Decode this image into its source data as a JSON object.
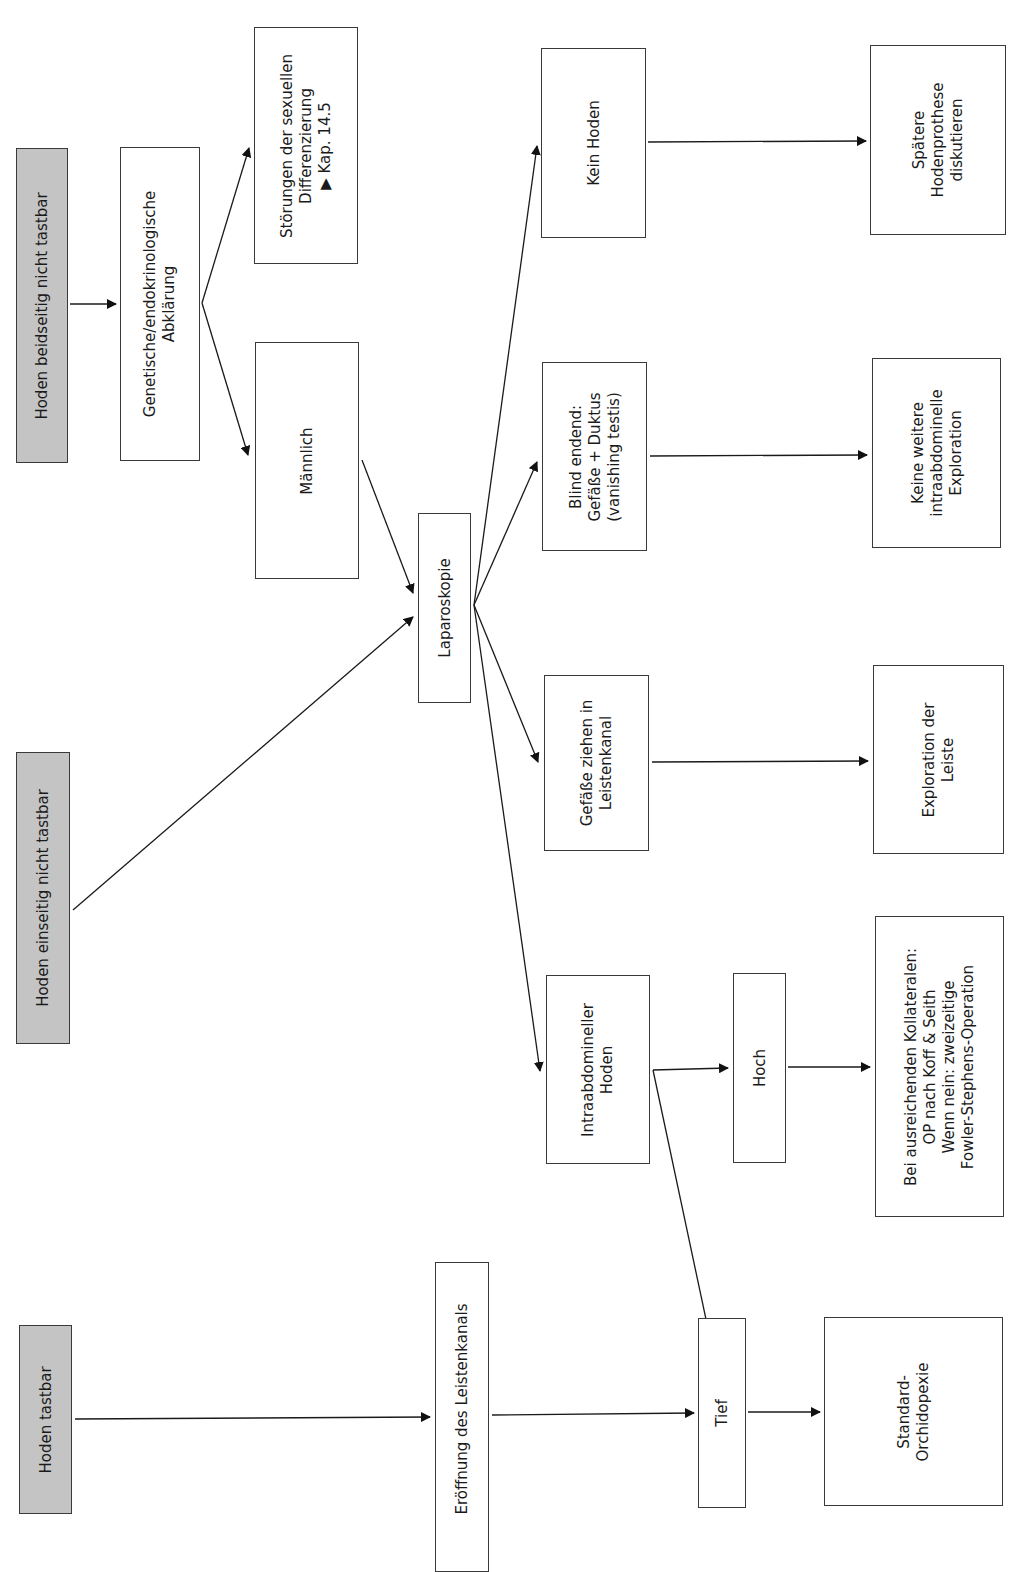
{
  "diagram": {
    "type": "flowchart",
    "orientation": "rotated-90-ccw",
    "colors": {
      "start_fill": "#c4c4c4",
      "box_fill": "#ffffff",
      "stroke": "#1a1a1a"
    },
    "nodes": {
      "beidseitig": {
        "lines": [
          "Hoden beidseitig nicht tastbar"
        ],
        "kind": "start"
      },
      "genetisch": {
        "lines": [
          "Genetische/endokrinologische",
          "Abklärung"
        ],
        "kind": "process"
      },
      "stoerungen": {
        "lines": [
          "Störungen der sexuellen",
          "Differenzierung",
          "▶ Kap. 14.5"
        ],
        "kind": "outcome"
      },
      "maennlich": {
        "lines": [
          "Männlich"
        ],
        "kind": "process"
      },
      "einseitig": {
        "lines": [
          "Hoden einseitig nicht tastbar"
        ],
        "kind": "start"
      },
      "laparoskopie": {
        "lines": [
          "Laparoskopie"
        ],
        "kind": "process"
      },
      "kein_hoden": {
        "lines": [
          "Kein Hoden"
        ],
        "kind": "finding"
      },
      "blind": {
        "lines": [
          "Blind endend:",
          "Gefäße + Duktus",
          "(vanishing testis)"
        ],
        "kind": "finding"
      },
      "gefaesse": {
        "lines": [
          "Gefäße ziehen in",
          "Leistenkanal"
        ],
        "kind": "finding"
      },
      "intraabdominell": {
        "lines": [
          "Intraabdomineller",
          "Hoden"
        ],
        "kind": "finding"
      },
      "hoch": {
        "lines": [
          "Hoch"
        ],
        "kind": "finding"
      },
      "tief": {
        "lines": [
          "Tief"
        ],
        "kind": "finding"
      },
      "prothese": {
        "lines": [
          "Spätere",
          "Hodenprothese",
          "diskutieren"
        ],
        "kind": "outcome"
      },
      "keine_weitere": {
        "lines": [
          "Keine weitere",
          "intraabdominelle",
          "Exploration"
        ],
        "kind": "outcome"
      },
      "exploration": {
        "lines": [
          "Exploration der",
          "Leiste"
        ],
        "kind": "outcome"
      },
      "kollateralen": {
        "lines": [
          "Bei ausreichenden Kollateralen:",
          "OP nach Koff & Seith",
          "Wenn nein: zweizeitige",
          "Fowler-Stephens-Operation"
        ],
        "kind": "outcome"
      },
      "tastbar": {
        "lines": [
          "Hoden tastbar"
        ],
        "kind": "start"
      },
      "eroeffnung": {
        "lines": [
          "Eröffnung des Leistenkanals"
        ],
        "kind": "process"
      },
      "orchidopexie": {
        "lines": [
          "Standard-",
          "Orchidopexie"
        ],
        "kind": "outcome"
      }
    },
    "edges": [
      {
        "from": "beidseitig",
        "to": "genetisch"
      },
      {
        "from": "genetisch",
        "to": "stoerungen"
      },
      {
        "from": "genetisch",
        "to": "maennlich"
      },
      {
        "from": "maennlich",
        "to": "laparoskopie"
      },
      {
        "from": "einseitig",
        "to": "laparoskopie"
      },
      {
        "from": "laparoskopie",
        "to": "kein_hoden"
      },
      {
        "from": "laparoskopie",
        "to": "blind"
      },
      {
        "from": "laparoskopie",
        "to": "gefaesse"
      },
      {
        "from": "laparoskopie",
        "to": "intraabdominell"
      },
      {
        "from": "kein_hoden",
        "to": "prothese"
      },
      {
        "from": "blind",
        "to": "keine_weitere"
      },
      {
        "from": "gefaesse",
        "to": "exploration"
      },
      {
        "from": "intraabdominell",
        "to": "hoch"
      },
      {
        "from": "intraabdominell",
        "to": "tief"
      },
      {
        "from": "hoch",
        "to": "kollateralen"
      },
      {
        "from": "tastbar",
        "to": "eroeffnung"
      },
      {
        "from": "eroeffnung",
        "to": "tief"
      },
      {
        "from": "tief",
        "to": "orchidopexie"
      }
    ]
  }
}
